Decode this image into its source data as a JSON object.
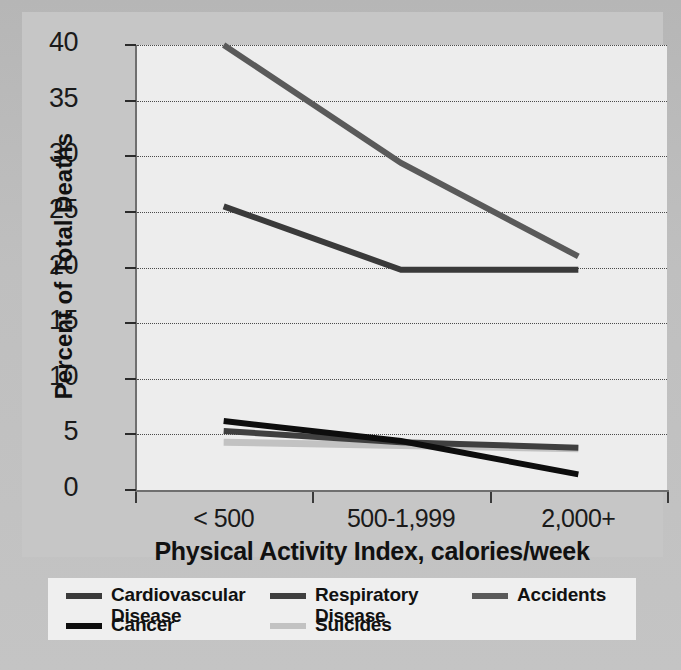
{
  "chart_data": {
    "type": "line",
    "title": "",
    "xlabel": "Physical Activity Index, calories/week",
    "ylabel": "Percent of Total Deaths",
    "categories": [
      "< 500",
      "500-1,999",
      "2,000+"
    ],
    "ylim": [
      0,
      40
    ],
    "yticks": [
      0,
      5,
      10,
      15,
      20,
      25,
      30,
      35,
      40
    ],
    "grid": "horizontal dotted gridlines",
    "legend_position": "bottom",
    "series": [
      {
        "name": "Cardiovascular Disease",
        "values": [
          25.5,
          19.8,
          19.8
        ],
        "color": "#3a3a3a"
      },
      {
        "name": "Respiratory Disease",
        "values": [
          5.3,
          4.3,
          3.8
        ],
        "color": "#3f3f3f"
      },
      {
        "name": "Accidents",
        "values": [
          40.0,
          29.4,
          21.0
        ],
        "color": "#5a5a5a"
      },
      {
        "name": "Cancer",
        "values": [
          6.2,
          4.4,
          1.4
        ],
        "color": "#0d0d0d"
      },
      {
        "name": "Suicides",
        "values": [
          4.3,
          4.0,
          3.7
        ],
        "color": "#c2c2c2"
      }
    ]
  },
  "axes": {
    "y_title": "Percent of Total Deaths",
    "x_title": "Physical Activity Index, calories/week",
    "y_tick_labels": [
      "0",
      "5",
      "10",
      "15",
      "20",
      "25",
      "30",
      "35",
      "40"
    ],
    "x_tick_labels": [
      "< 500",
      "500-1,999",
      "2,000+"
    ]
  },
  "legend": {
    "entries": [
      {
        "label": "Cardiovascular\nDisease",
        "color": "#3a3a3a"
      },
      {
        "label": "Respiratory\nDisease",
        "color": "#3f3f3f"
      },
      {
        "label": "Accidents",
        "color": "#5a5a5a"
      },
      {
        "label": "Cancer",
        "color": "#0d0d0d"
      },
      {
        "label": "Suicides",
        "color": "#c2c2c2"
      }
    ]
  }
}
